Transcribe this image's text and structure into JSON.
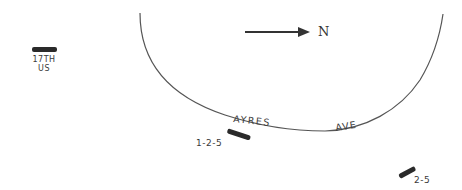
{
  "compass": {
    "label": "N",
    "direction": "right"
  },
  "street": {
    "name_part1": "AYRES",
    "name_part2": "AVE"
  },
  "markers": [
    {
      "id": "17th-us",
      "line1": "17TH",
      "line2": "US"
    },
    {
      "id": "1-2-5",
      "label": "1-2-5"
    },
    {
      "id": "2-5",
      "label": "2-5"
    }
  ],
  "colors": {
    "line": "#555555",
    "marker": "#2a2a2a",
    "background": "#ffffff"
  }
}
